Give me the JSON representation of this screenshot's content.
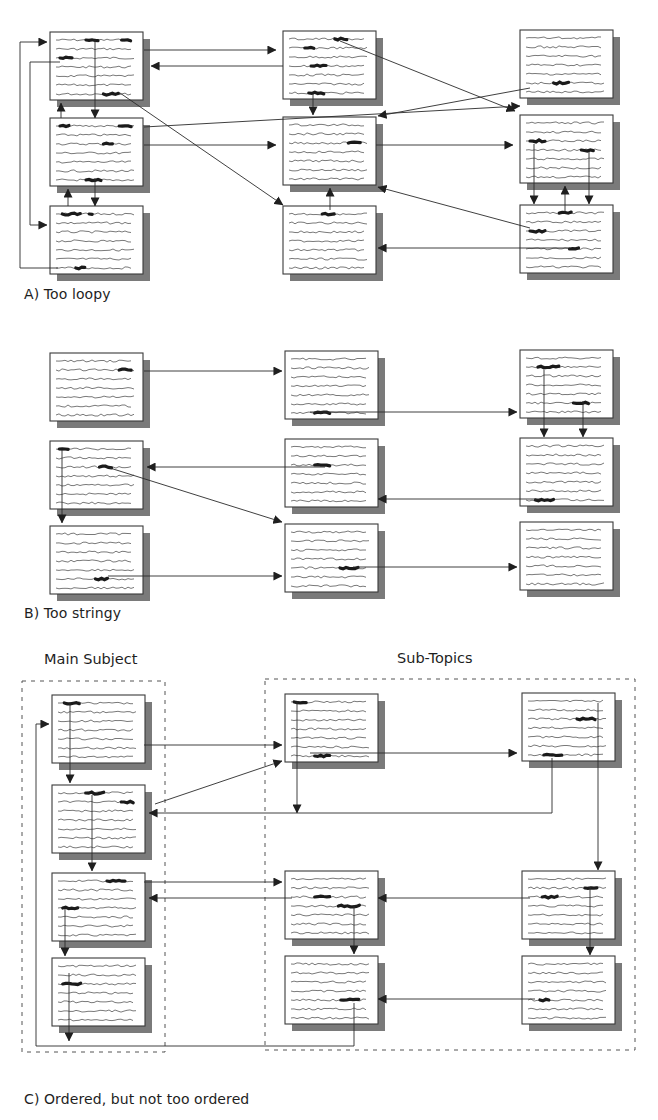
{
  "colors": {
    "ink": "#2a2a2a",
    "text_line": "#6a6a6a",
    "highlight": "#1a1a1a",
    "shadow": "#7a7a7a",
    "page_fill": "#ffffff",
    "page_border": "#3a3a3a",
    "dash": "#555555"
  },
  "page_size": {
    "w": 93,
    "h": 68,
    "shadow_offset": 7,
    "lines": 7
  },
  "sections": [
    {
      "id": "A",
      "caption": "A) Too loopy",
      "caption_pos": {
        "x": 24,
        "y": 286
      },
      "pages": [
        {
          "id": "A11",
          "x": 50,
          "y": 32,
          "hl": [
            [
              3,
              1,
              0.38,
              0.55
            ],
            [
              2,
              1,
              0.83,
              0.97
            ],
            [
              1,
              3,
              0.05,
              0.22
            ],
            [
              4,
              7,
              0.6,
              0.8
            ]
          ]
        },
        {
          "id": "A21",
          "x": 50,
          "y": 118,
          "hl": [
            [
              1,
              1,
              0.05,
              0.2
            ],
            [
              2,
              1,
              0.8,
              0.97
            ],
            [
              3,
              3,
              0.6,
              0.75
            ],
            [
              4,
              7,
              0.38,
              0.6
            ]
          ]
        },
        {
          "id": "A31",
          "x": 50,
          "y": 206,
          "hl": [
            [
              1,
              1,
              0.08,
              0.32
            ],
            [
              2,
              1,
              0.42,
              0.47
            ],
            [
              3,
              7,
              0.25,
              0.4
            ]
          ]
        },
        {
          "id": "A12",
          "x": 283,
          "y": 31,
          "hl": [
            [
              1,
              2,
              0.2,
              0.32
            ],
            [
              2,
              1,
              0.58,
              0.74
            ],
            [
              3,
              4,
              0.28,
              0.5
            ],
            [
              4,
              7,
              0.25,
              0.45
            ]
          ]
        },
        {
          "id": "A22",
          "x": 283,
          "y": 117,
          "hl": [
            [
              1,
              3,
              0.75,
              0.92
            ]
          ]
        },
        {
          "id": "A32",
          "x": 283,
          "y": 206,
          "hl": [
            [
              1,
              1,
              0.42,
              0.6
            ]
          ]
        },
        {
          "id": "A13",
          "x": 520,
          "y": 30,
          "hl": [
            [
              1,
              6,
              0.35,
              0.55
            ]
          ]
        },
        {
          "id": "A23",
          "x": 520,
          "y": 115,
          "hl": [
            [
              1,
              3,
              0.05,
              0.27
            ],
            [
              2,
              4,
              0.7,
              0.88
            ]
          ]
        },
        {
          "id": "A33",
          "x": 520,
          "y": 205,
          "hl": [
            [
              1,
              1,
              0.42,
              0.6
            ],
            [
              2,
              3,
              0.05,
              0.27
            ],
            [
              3,
              5,
              0.55,
              0.7
            ]
          ]
        }
      ],
      "arrows": [
        {
          "pts": [
            [
              144,
              50
            ],
            [
              276,
              50
            ]
          ]
        },
        {
          "pts": [
            [
              283,
              66
            ],
            [
              151,
              66
            ]
          ]
        },
        {
          "pts": [
            [
              144,
              52
            ],
            [
              144,
              52
            ]
          ]
        },
        {
          "pts": [
            [
              95,
              40
            ],
            [
              95,
              118
            ]
          ]
        },
        {
          "pts": [
            [
              61,
              118
            ],
            [
              61,
              103
            ]
          ]
        },
        {
          "pts": [
            [
              95,
              178
            ],
            [
              95,
              206
            ]
          ]
        },
        {
          "pts": [
            [
              68,
              206
            ],
            [
              68,
              189
            ]
          ]
        },
        {
          "pts": [
            [
              60,
              62
            ],
            [
              30,
              62
            ],
            [
              30,
              225
            ],
            [
              47,
              225
            ]
          ]
        },
        {
          "pts": [
            [
              58,
              268
            ],
            [
              20,
              268
            ],
            [
              20,
              42
            ],
            [
              47,
              42
            ]
          ]
        },
        {
          "pts": [
            [
              120,
              93
            ],
            [
              283,
              205
            ]
          ]
        },
        {
          "pts": [
            [
              144,
              127
            ],
            [
              520,
              106
            ]
          ]
        },
        {
          "pts": [
            [
              144,
              145
            ],
            [
              276,
              145
            ]
          ]
        },
        {
          "pts": [
            [
              313,
              94
            ],
            [
              313,
              115
            ]
          ]
        },
        {
          "pts": [
            [
              376,
              145
            ],
            [
              513,
              145
            ]
          ]
        },
        {
          "pts": [
            [
              330,
              210
            ],
            [
              330,
              188
            ]
          ]
        },
        {
          "pts": [
            [
              340,
              41
            ],
            [
              515,
              111
            ]
          ]
        },
        {
          "pts": [
            [
              530,
              88
            ],
            [
              378,
              116
            ]
          ]
        },
        {
          "pts": [
            [
              530,
              228
            ],
            [
              378,
              187
            ]
          ]
        },
        {
          "pts": [
            [
              570,
              248
            ],
            [
              378,
              248
            ]
          ]
        },
        {
          "pts": [
            [
              534,
              144
            ],
            [
              534,
              204
            ]
          ]
        },
        {
          "pts": [
            [
              589,
              152
            ],
            [
              589,
              204
            ]
          ]
        },
        {
          "pts": [
            [
              565,
              212
            ],
            [
              565,
              186
            ]
          ]
        }
      ]
    },
    {
      "id": "B",
      "caption": "B) Too stringy",
      "caption_pos": {
        "x": 24,
        "y": 605
      },
      "pages": [
        {
          "id": "B11",
          "x": 50,
          "y": 353,
          "hl": [
            [
              1,
              2,
              0.8,
              0.97
            ]
          ]
        },
        {
          "id": "B21",
          "x": 50,
          "y": 441,
          "hl": [
            [
              1,
              1,
              0.04,
              0.18
            ],
            [
              2,
              3,
              0.55,
              0.72
            ]
          ]
        },
        {
          "id": "B31",
          "x": 50,
          "y": 526,
          "hl": [
            [
              1,
              6,
              0.5,
              0.68
            ]
          ]
        },
        {
          "id": "B12",
          "x": 285,
          "y": 351,
          "hl": [
            [
              1,
              7,
              0.3,
              0.5
            ]
          ]
        },
        {
          "id": "B22",
          "x": 285,
          "y": 439,
          "hl": [
            [
              1,
              3,
              0.3,
              0.5
            ]
          ]
        },
        {
          "id": "B32",
          "x": 285,
          "y": 524,
          "hl": [
            [
              1,
              5,
              0.62,
              0.88
            ]
          ]
        },
        {
          "id": "B13",
          "x": 520,
          "y": 350,
          "hl": [
            [
              1,
              2,
              0.15,
              0.45
            ],
            [
              2,
              6,
              0.6,
              0.8
            ]
          ]
        },
        {
          "id": "B23",
          "x": 520,
          "y": 438,
          "hl": [
            [
              1,
              7,
              0.12,
              0.38
            ]
          ]
        },
        {
          "id": "B33",
          "x": 520,
          "y": 522,
          "hl": []
        }
      ],
      "arrows": [
        {
          "pts": [
            [
              144,
              371
            ],
            [
              282,
              371
            ]
          ]
        },
        {
          "pts": [
            [
              310,
              412
            ],
            [
              517,
              412
            ]
          ]
        },
        {
          "pts": [
            [
              544,
              370
            ],
            [
              544,
              437
            ]
          ]
        },
        {
          "pts": [
            [
              583,
              401
            ],
            [
              583,
              437
            ]
          ]
        },
        {
          "pts": [
            [
              325,
              467
            ],
            [
              147,
              467
            ]
          ]
        },
        {
          "pts": [
            [
              540,
              499
            ],
            [
              378,
              499
            ]
          ]
        },
        {
          "pts": [
            [
              62,
              450
            ],
            [
              62,
              523
            ]
          ]
        },
        {
          "pts": [
            [
              110,
              468
            ],
            [
              282,
              522
            ]
          ]
        },
        {
          "pts": [
            [
              108,
              576
            ],
            [
              282,
              576
            ]
          ]
        },
        {
          "pts": [
            [
              353,
              567
            ],
            [
              517,
              567
            ]
          ]
        }
      ]
    },
    {
      "id": "C",
      "caption": "C) Ordered, but not too ordered",
      "caption_pos": {
        "x": 24,
        "y": 1091
      },
      "groups": [
        {
          "id": "main-subject",
          "title": "Main Subject",
          "title_pos": {
            "x": 44,
            "y": 651
          },
          "box": {
            "x": 22,
            "y": 681,
            "w": 143,
            "h": 371
          }
        },
        {
          "id": "sub-topics",
          "title": "Sub-Topics",
          "title_pos": {
            "x": 397,
            "y": 650
          },
          "box": {
            "x": 265,
            "y": 679,
            "w": 370,
            "h": 371
          }
        }
      ],
      "pages": [
        {
          "id": "C11",
          "x": 52,
          "y": 695,
          "hl": [
            [
              1,
              1,
              0.08,
              0.3
            ]
          ]
        },
        {
          "id": "C21",
          "x": 52,
          "y": 785,
          "hl": [
            [
              1,
              1,
              0.35,
              0.6
            ],
            [
              2,
              2,
              0.8,
              0.97
            ]
          ]
        },
        {
          "id": "C31",
          "x": 52,
          "y": 873,
          "hl": [
            [
              1,
              1,
              0.62,
              0.88
            ],
            [
              2,
              4,
              0.06,
              0.25
            ]
          ]
        },
        {
          "id": "C41",
          "x": 52,
          "y": 958,
          "hl": [
            [
              1,
              3,
              0.06,
              0.3
            ]
          ]
        },
        {
          "id": "C12",
          "x": 285,
          "y": 694,
          "hl": [
            [
              1,
              1,
              0.04,
              0.22
            ],
            [
              2,
              7,
              0.3,
              0.5
            ]
          ]
        },
        {
          "id": "C13",
          "x": 522,
          "y": 693,
          "hl": [
            [
              1,
              3,
              0.62,
              0.88
            ],
            [
              2,
              7,
              0.2,
              0.45
            ]
          ]
        },
        {
          "id": "C22",
          "x": 285,
          "y": 871,
          "hl": [
            [
              1,
              3,
              0.3,
              0.5
            ],
            [
              2,
              4,
              0.6,
              0.87
            ]
          ]
        },
        {
          "id": "C32",
          "x": 285,
          "y": 956,
          "hl": [
            [
              1,
              5,
              0.63,
              0.88
            ]
          ]
        },
        {
          "id": "C23",
          "x": 522,
          "y": 871,
          "hl": [
            [
              1,
              2,
              0.72,
              0.88
            ],
            [
              2,
              3,
              0.18,
              0.38
            ]
          ]
        },
        {
          "id": "C33",
          "x": 522,
          "y": 956,
          "hl": [
            [
              1,
              5,
              0.15,
              0.3
            ]
          ]
        }
      ],
      "arrows": [
        {
          "pts": [
            [
              70,
              702
            ],
            [
              70,
              783
            ]
          ]
        },
        {
          "pts": [
            [
              144,
              745
            ],
            [
              282,
              745
            ]
          ]
        },
        {
          "pts": [
            [
              155,
              804
            ],
            [
              282,
              761
            ]
          ]
        },
        {
          "pts": [
            [
              92,
              795
            ],
            [
              92,
              871
            ]
          ]
        },
        {
          "pts": [
            [
              144,
              882
            ],
            [
              282,
              882
            ]
          ]
        },
        {
          "pts": [
            [
              292,
              898
            ],
            [
              149,
              898
            ]
          ]
        },
        {
          "pts": [
            [
              65,
              909
            ],
            [
              65,
              956
            ]
          ]
        },
        {
          "pts": [
            [
              69,
              973
            ],
            [
              69,
              1041
            ]
          ]
        },
        {
          "pts": [
            [
              354,
              905
            ],
            [
              354,
              954
            ]
          ]
        },
        {
          "pts": [
            [
              310,
              753
            ],
            [
              517,
              753
            ]
          ]
        },
        {
          "pts": [
            [
              297,
              702
            ],
            [
              297,
              813
            ]
          ]
        },
        {
          "pts": [
            [
              552,
              758
            ],
            [
              552,
              813
            ],
            [
              149,
              813
            ]
          ]
        },
        {
          "pts": [
            [
              598,
              703
            ],
            [
              598,
              870
            ]
          ]
        },
        {
          "pts": [
            [
              530,
              898
            ],
            [
              378,
              898
            ]
          ]
        },
        {
          "pts": [
            [
              590,
              887
            ],
            [
              590,
              955
            ]
          ]
        },
        {
          "pts": [
            [
              535,
              999
            ],
            [
              378,
              999
            ]
          ]
        },
        {
          "pts": [
            [
              354,
              1003
            ],
            [
              354,
              1046
            ],
            [
              36,
              1046
            ],
            [
              36,
              724
            ],
            [
              49,
              724
            ]
          ]
        }
      ]
    }
  ]
}
